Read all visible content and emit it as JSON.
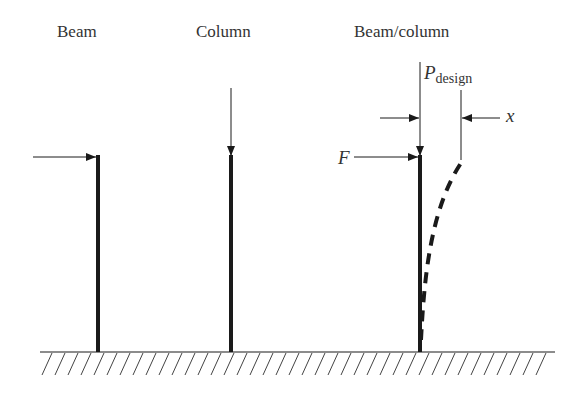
{
  "titles": {
    "beam": "Beam",
    "column": "Column",
    "beam_column": "Beam/column"
  },
  "symbols": {
    "p_main": "P",
    "p_sub": "design",
    "force": "F",
    "deflection": "x"
  },
  "colors": {
    "stroke": "#1a1a1a",
    "text": "#333333",
    "background": "#ffffff"
  }
}
